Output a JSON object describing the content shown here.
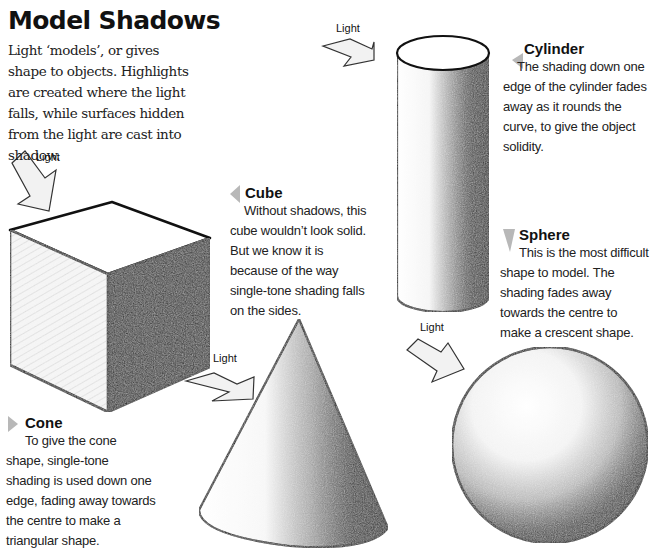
{
  "page": {
    "title": "Model Shadows",
    "intro": "Light ‘models’, or gives shape to objects. Highlights are created where the light falls, while surfaces hidden from the light are cast into shadow."
  },
  "light_labels": {
    "cube": "Light",
    "cylinder": "Light",
    "cone": "Light",
    "sphere": "Light"
  },
  "captions": {
    "cylinder": {
      "title": "Cylinder",
      "body": "The shading down one edge of the cylinder fades away as it rounds the curve, to give the object solidity.",
      "marker_direction": "left"
    },
    "cube": {
      "title": "Cube",
      "body": "Without shadows, this cube wouldn’t look solid. But we know it is because of the way single-tone shading falls on the sides.",
      "marker_direction": "left"
    },
    "sphere": {
      "title": "Sphere",
      "body": "This is the most difficult shape to model. The shading fades away towards the centre to make a crescent shape.",
      "marker_direction": "down"
    },
    "cone": {
      "title": "Cone",
      "body": "To give the cone shape, single-tone shading is used down one edge, fading away towards the centre to make a triangular shape.",
      "marker_direction": "right"
    }
  },
  "colors": {
    "marker": "#b8b8b8",
    "arrow_fill": "#f2f2f2",
    "outline": "#111111"
  }
}
